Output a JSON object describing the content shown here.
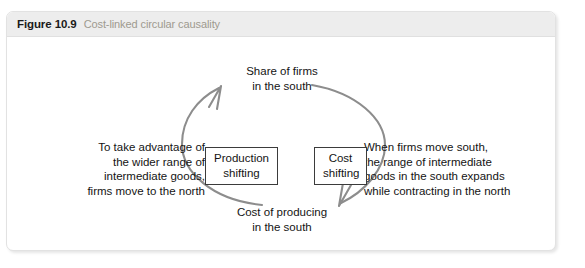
{
  "figure": {
    "number": "Figure 10.9",
    "caption": "Cost-linked circular causality",
    "header_bg": "#ededed",
    "caption_color": "#9e9a8f"
  },
  "diagram": {
    "type": "circular-causality-loop",
    "arc_color": "#8d8d8d",
    "nodes": {
      "top": "Share of firms\nin the south",
      "bottom": "Cost of producing\nin the south",
      "left": "To take advantage of\nthe wider range of\nintermediate goods,\nfirms move to the north",
      "right": "When firms move south,\nthe range of intermediate\ngoods in the south expands\nwhile contracting in the north"
    },
    "boxes": {
      "production": "Production\nshifting",
      "cost": "Cost\nshifting"
    },
    "arrows": [
      {
        "name": "left-arc-upward",
        "from": "Cost of producing in the south",
        "to": "Share of firms in the south",
        "via": "Production shifting",
        "direction": "counter-clockwise"
      },
      {
        "name": "right-arc-downward",
        "from": "Share of firms in the south",
        "to": "Cost of producing in the south",
        "via": "Cost shifting",
        "direction": "clockwise"
      }
    ]
  }
}
